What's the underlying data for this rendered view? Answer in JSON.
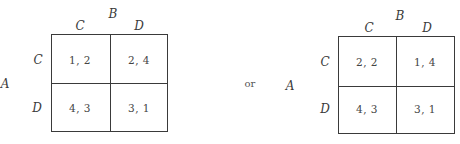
{
  "connector_text": "or",
  "games": [
    {
      "row_player": "A",
      "col_player": "B",
      "col_strategies": [
        "C",
        "D"
      ],
      "row_strategies": [
        "C",
        "D"
      ],
      "payoffs": [
        [
          "1, 2",
          "2, 4"
        ],
        [
          "4, 3",
          "3, 1"
        ]
      ]
    },
    {
      "row_player": "A",
      "col_player": "B",
      "col_strategies": [
        "C",
        "D"
      ],
      "row_strategies": [
        "C",
        "D"
      ],
      "payoffs": [
        [
          "2, 2",
          "1, 4"
        ],
        [
          "4, 3",
          "3, 1"
        ]
      ]
    }
  ]
}
